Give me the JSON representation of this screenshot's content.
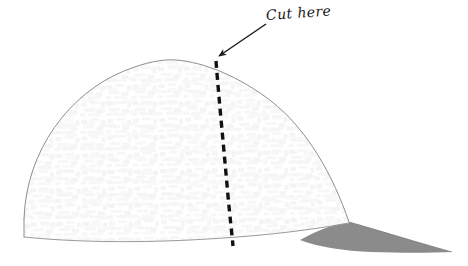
{
  "figure": {
    "annotation": {
      "label": "Cut here",
      "text_color": "#1a1a1a",
      "leader_arrow": {
        "from_x": 266,
        "from_y": 24,
        "to_x": 216,
        "to_y": 58,
        "color": "#1a1a1a"
      }
    },
    "cut_line": {
      "name": "dashed-cut-line",
      "color": "#111111",
      "width": 3.2,
      "dash_length": 7,
      "dash_gap": 5,
      "start_x": 216,
      "start_y": 61,
      "end_x": 233,
      "end_y": 246
    },
    "cap_crown": {
      "name": "cap-crown",
      "outline_color": "#8e8e92",
      "outline_width": 1,
      "fill_color": "#ffffff",
      "apex_x": 176,
      "apex_y": 60,
      "left_x": 24,
      "left_y": 219,
      "right_x": 349,
      "right_y": 222
    },
    "cap_brim": {
      "name": "cap-brim",
      "fill_color": "#8b8b8b",
      "tip_x": 452,
      "tip_y": 252,
      "inner_x": 300,
      "inner_y": 240
    },
    "texture": {
      "name": "fabric-texture",
      "color": "#f4f4f6",
      "opacity": 0.9
    },
    "canvas": {
      "width": 468,
      "height": 266,
      "background": "#ffffff"
    }
  }
}
